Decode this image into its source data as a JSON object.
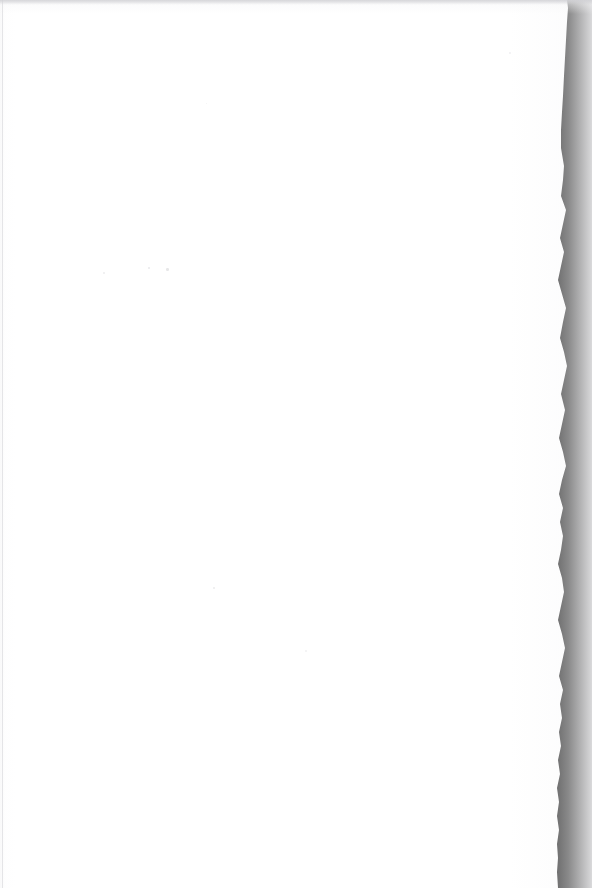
{
  "document": {
    "kind": "scanned-page",
    "page_content_text": "",
    "page_state_label": "blank",
    "caption": "Blank scanned page with torn right edge against black scanner background"
  },
  "canvas": {
    "width_px": 592,
    "height_px": 888
  },
  "colors": {
    "paper": "#ffffff",
    "scanner_void": "#000000",
    "paper_shadow": "#e4e4e6",
    "speck": "#b0b0b6",
    "margin_line": "#d2d2d6"
  },
  "paper": {
    "left_edge_x": 0,
    "top_edge_y": 0,
    "bottom_edge_y": 888,
    "right_edge_profile": [
      {
        "y": 0,
        "x": 567
      },
      {
        "y": 8,
        "x": 568
      },
      {
        "y": 22,
        "x": 567
      },
      {
        "y": 40,
        "x": 566
      },
      {
        "y": 58,
        "x": 565
      },
      {
        "y": 76,
        "x": 564
      },
      {
        "y": 96,
        "x": 563
      },
      {
        "y": 112,
        "x": 562
      },
      {
        "y": 130,
        "x": 561
      },
      {
        "y": 148,
        "x": 561
      },
      {
        "y": 166,
        "x": 564
      },
      {
        "y": 180,
        "x": 563
      },
      {
        "y": 196,
        "x": 561
      },
      {
        "y": 210,
        "x": 566
      },
      {
        "y": 224,
        "x": 563
      },
      {
        "y": 238,
        "x": 560
      },
      {
        "y": 252,
        "x": 564
      },
      {
        "y": 266,
        "x": 561
      },
      {
        "y": 280,
        "x": 558
      },
      {
        "y": 294,
        "x": 562
      },
      {
        "y": 308,
        "x": 566
      },
      {
        "y": 322,
        "x": 563
      },
      {
        "y": 338,
        "x": 560
      },
      {
        "y": 352,
        "x": 564
      },
      {
        "y": 366,
        "x": 567
      },
      {
        "y": 380,
        "x": 564
      },
      {
        "y": 394,
        "x": 561
      },
      {
        "y": 410,
        "x": 565
      },
      {
        "y": 424,
        "x": 562
      },
      {
        "y": 438,
        "x": 559
      },
      {
        "y": 452,
        "x": 563
      },
      {
        "y": 466,
        "x": 566
      },
      {
        "y": 480,
        "x": 562
      },
      {
        "y": 494,
        "x": 559
      },
      {
        "y": 508,
        "x": 563
      },
      {
        "y": 522,
        "x": 560
      },
      {
        "y": 536,
        "x": 563
      },
      {
        "y": 550,
        "x": 561
      },
      {
        "y": 564,
        "x": 558
      },
      {
        "y": 578,
        "x": 562
      },
      {
        "y": 592,
        "x": 564
      },
      {
        "y": 606,
        "x": 561
      },
      {
        "y": 620,
        "x": 558
      },
      {
        "y": 634,
        "x": 562
      },
      {
        "y": 648,
        "x": 565
      },
      {
        "y": 662,
        "x": 562
      },
      {
        "y": 676,
        "x": 559
      },
      {
        "y": 690,
        "x": 563
      },
      {
        "y": 704,
        "x": 560
      },
      {
        "y": 718,
        "x": 562
      },
      {
        "y": 732,
        "x": 559
      },
      {
        "y": 746,
        "x": 561
      },
      {
        "y": 760,
        "x": 558
      },
      {
        "y": 774,
        "x": 560
      },
      {
        "y": 788,
        "x": 557
      },
      {
        "y": 802,
        "x": 559
      },
      {
        "y": 816,
        "x": 557
      },
      {
        "y": 830,
        "x": 559
      },
      {
        "y": 844,
        "x": 557
      },
      {
        "y": 858,
        "x": 558
      },
      {
        "y": 872,
        "x": 557
      },
      {
        "y": 888,
        "x": 558
      }
    ]
  },
  "artifacts": {
    "specks": [
      {
        "x": 148,
        "y": 267,
        "size": 2.2,
        "opacity": 0.45
      },
      {
        "x": 166,
        "y": 268,
        "size": 2.6,
        "opacity": 0.5
      },
      {
        "x": 103,
        "y": 272,
        "size": 1.6,
        "opacity": 0.35
      },
      {
        "x": 213,
        "y": 587,
        "size": 2.4,
        "opacity": 0.42
      },
      {
        "x": 509,
        "y": 52,
        "size": 1.8,
        "opacity": 0.3
      },
      {
        "x": 305,
        "y": 650,
        "size": 1.5,
        "opacity": 0.28
      },
      {
        "x": 206,
        "y": 103,
        "size": 1.4,
        "opacity": 0.26
      }
    ]
  }
}
